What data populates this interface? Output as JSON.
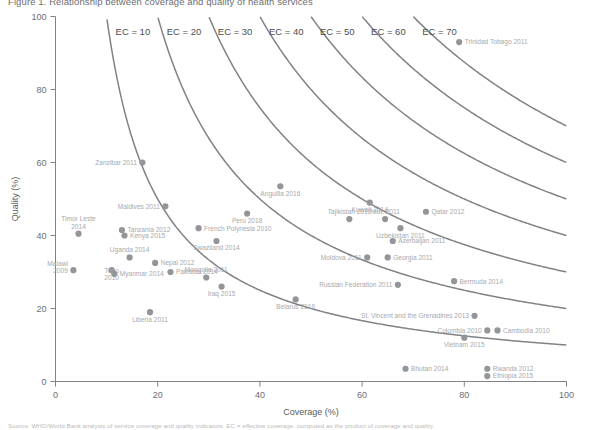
{
  "figure": {
    "title": "Figure 1.  Relationship between coverage and quality of health services",
    "note": "Source: WHO/World Bank analysis of service coverage and quality indicators. EC = effective coverage, computed as the product of coverage and quality."
  },
  "chart_data": {
    "type": "scatter",
    "title": "Relationship between coverage and quality of health services",
    "xlabel": "Coverage (%)",
    "ylabel": "Quality (%)",
    "xlim": [
      0,
      100
    ],
    "ylim": [
      0,
      100
    ],
    "xticks": [
      0,
      20,
      40,
      60,
      80,
      100
    ],
    "yticks": [
      0,
      20,
      40,
      60,
      80,
      100
    ],
    "grid": false,
    "legend_position": "none",
    "marker_color": "#939598",
    "curve_color": "#808285",
    "annotation_curves": {
      "description": "Iso-effective-coverage hyperbolas y = EC*100/x",
      "label_prefix": "EC = ",
      "levels": [
        10,
        20,
        30,
        40,
        50,
        60,
        70
      ],
      "labels": [
        "EC = 10",
        "EC = 20",
        "EC = 30",
        "EC = 40",
        "EC = 50",
        "EC = 60",
        "EC = 70"
      ]
    },
    "points": [
      {
        "label": "Trinidad Tobago 2011",
        "x": 79.0,
        "y": 93.0,
        "lpos": "right"
      },
      {
        "label": "Zanzibar 2011",
        "x": 17.0,
        "y": 60.0,
        "lpos": "left"
      },
      {
        "label": "Maldives 2011",
        "x": 21.5,
        "y": 48.0,
        "lpos": "left"
      },
      {
        "label": "Anguilla 2016",
        "x": 44.0,
        "y": 53.5,
        "lpos": "below"
      },
      {
        "label": "Kuwait 2014",
        "x": 61.5,
        "y": 49.0,
        "lpos": "below"
      },
      {
        "label": "Qatar 2012",
        "x": 72.5,
        "y": 46.5,
        "lpos": "right"
      },
      {
        "label": "Tajikistan 2011",
        "x": 57.5,
        "y": 44.5,
        "lpos": "above"
      },
      {
        "label": "Niue 2011",
        "x": 64.5,
        "y": 44.5,
        "lpos": "above"
      },
      {
        "label": "Uzbekistan 2011",
        "x": 67.5,
        "y": 42.0,
        "lpos": "below"
      },
      {
        "label": "Azerbaijan 2011",
        "x": 66.0,
        "y": 38.5,
        "lpos": "right"
      },
      {
        "label": "Peru 2018",
        "x": 37.5,
        "y": 46.0,
        "lpos": "below"
      },
      {
        "label": "French Polynesia 2010",
        "x": 28.0,
        "y": 42.0,
        "lpos": "right"
      },
      {
        "label": "Timor Leste 2014",
        "x": 4.5,
        "y": 40.5,
        "lpos": "above"
      },
      {
        "label": "Tanzania 2012",
        "x": 13.0,
        "y": 41.5,
        "lpos": "right"
      },
      {
        "label": "Kenya 2015",
        "x": 13.5,
        "y": 40.0,
        "lpos": "right"
      },
      {
        "label": "Swaziland 2014",
        "x": 31.5,
        "y": 38.5,
        "lpos": "below"
      },
      {
        "label": "Uganda 2014",
        "x": 14.5,
        "y": 34.0,
        "lpos": "above"
      },
      {
        "label": "Moldova 2011",
        "x": 61.0,
        "y": 34.0,
        "lpos": "left"
      },
      {
        "label": "Georgia 2011",
        "x": 65.0,
        "y": 34.0,
        "lpos": "right"
      },
      {
        "label": "Nepal 2012",
        "x": 19.5,
        "y": 32.5,
        "lpos": "right"
      },
      {
        "label": "Malawi 2009",
        "x": 3.5,
        "y": 30.5,
        "lpos": "left"
      },
      {
        "label": "Togo 2010",
        "x": 11.0,
        "y": 30.5,
        "lpos": "below"
      },
      {
        "label": "Myanmar 2014",
        "x": 11.5,
        "y": 29.5,
        "lpos": "right"
      },
      {
        "label": "Pakistan 2014",
        "x": 22.5,
        "y": 30.0,
        "lpos": "right"
      },
      {
        "label": "Mongolia 2011",
        "x": 29.5,
        "y": 28.5,
        "lpos": "above"
      },
      {
        "label": "Iraq 2015",
        "x": 32.5,
        "y": 26.0,
        "lpos": "below"
      },
      {
        "label": "Russian Federation 2011",
        "x": 67.0,
        "y": 26.5,
        "lpos": "left"
      },
      {
        "label": "Bermuda 2014",
        "x": 78.0,
        "y": 27.5,
        "lpos": "right"
      },
      {
        "label": "Belarus 2016",
        "x": 47.0,
        "y": 22.5,
        "lpos": "below"
      },
      {
        "label": "Liberia 2011",
        "x": 18.5,
        "y": 19.0,
        "lpos": "below"
      },
      {
        "label": "St. Vincent and the Grenadines 2013",
        "x": 82.0,
        "y": 18.0,
        "lpos": "left"
      },
      {
        "label": "Colombia 2010",
        "x": 84.5,
        "y": 14.0,
        "lpos": "left"
      },
      {
        "label": "Cambodia 2010",
        "x": 86.5,
        "y": 14.0,
        "lpos": "right"
      },
      {
        "label": "Vietnam 2015",
        "x": 80.0,
        "y": 12.0,
        "lpos": "below"
      },
      {
        "label": "Bhutan 2014",
        "x": 68.5,
        "y": 3.5,
        "lpos": "right"
      },
      {
        "label": "Rwanda 2012",
        "x": 84.5,
        "y": 3.5,
        "lpos": "right"
      },
      {
        "label": "Ethiopia 2015",
        "x": 84.5,
        "y": 1.5,
        "lpos": "right"
      }
    ]
  }
}
